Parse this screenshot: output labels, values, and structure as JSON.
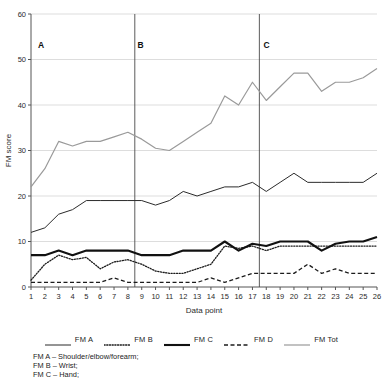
{
  "chart_data": {
    "type": "line",
    "title": "",
    "xlabel": "Data point",
    "ylabel": "FM score",
    "xlim": [
      1,
      26
    ],
    "ylim": [
      0,
      60
    ],
    "yticks": [
      0,
      10,
      20,
      30,
      40,
      50,
      60
    ],
    "grid": "horizontal",
    "legend_position": "bottom",
    "x": [
      1,
      2,
      3,
      4,
      5,
      6,
      7,
      8,
      9,
      10,
      11,
      12,
      13,
      14,
      15,
      16,
      17,
      18,
      19,
      20,
      21,
      22,
      23,
      24,
      25,
      26
    ],
    "xticklabels": [
      "1",
      "2",
      "3",
      "4",
      "5",
      "6",
      "7",
      "8",
      "9",
      "10",
      "11",
      "12",
      "13",
      "14",
      "15",
      "16",
      "17",
      "18",
      "19",
      "20",
      "21",
      "22",
      "23",
      "24",
      "25",
      "26"
    ],
    "series": [
      {
        "name": "FM A",
        "style": "solid-thin",
        "color": "#2b2b2b",
        "values": [
          12,
          13,
          16,
          17,
          19,
          19,
          19,
          19,
          19,
          18,
          19,
          21,
          20,
          21,
          22,
          22,
          23,
          21,
          23,
          25,
          23,
          23,
          23,
          23,
          23,
          25
        ]
      },
      {
        "name": "FM B",
        "style": "dotted",
        "color": "#1c1c1c",
        "values": [
          1.5,
          5,
          7,
          6,
          6.5,
          4,
          5.5,
          6,
          5,
          3.5,
          3,
          3,
          4,
          5,
          9,
          8.5,
          9,
          8,
          9,
          9,
          9,
          9,
          9,
          9,
          9,
          9
        ]
      },
      {
        "name": "FM C",
        "style": "solid-thick",
        "color": "#111111",
        "values": [
          7,
          7,
          8,
          7,
          8,
          8,
          8,
          8,
          7,
          7,
          7,
          8,
          8,
          8,
          10,
          8,
          9.5,
          9,
          10,
          10,
          10,
          8,
          9.5,
          10,
          10,
          11
        ]
      },
      {
        "name": "FM D",
        "style": "dashed",
        "color": "#1c1c1c",
        "values": [
          1,
          1,
          1,
          1,
          1,
          1,
          2,
          1,
          1,
          1,
          1,
          1,
          1,
          2,
          1,
          2,
          3,
          3,
          3,
          3,
          5,
          3,
          4,
          3,
          3,
          3
        ]
      },
      {
        "name": "FM Tot",
        "style": "solid-light",
        "color": "#9a9a9a",
        "values": [
          22,
          26,
          32,
          31,
          32,
          32,
          33,
          34,
          32.5,
          30.5,
          30,
          32,
          34,
          36,
          42,
          40,
          45,
          41,
          44,
          47,
          47,
          43,
          45,
          45,
          46,
          48
        ]
      }
    ],
    "phase_markers": [
      {
        "label": "A",
        "label_x": 1.5,
        "line_x": null
      },
      {
        "label": "B",
        "label_x": 8.7,
        "line_x": 8.5
      },
      {
        "label": "C",
        "label_x": 17.8,
        "line_x": 17.5
      }
    ]
  },
  "legend": {
    "items": [
      {
        "label": "FM A",
        "style": "solid-thin"
      },
      {
        "label": "FM B",
        "style": "dotted"
      },
      {
        "label": "FM C",
        "style": "solid-thick"
      },
      {
        "label": "FM D",
        "style": "dashed"
      },
      {
        "label": "FM Tot",
        "style": "solid-light"
      }
    ]
  },
  "caption": {
    "line1": "FM A – Shoulder/elbow/forearm;",
    "line2": "FM B – Wrist;",
    "line3": "FM C – Hand;"
  }
}
